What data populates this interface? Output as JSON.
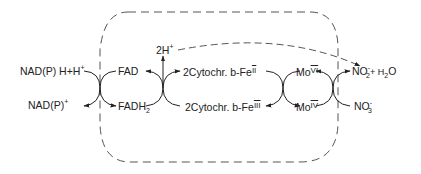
{
  "diagram": {
    "colors": {
      "ink": "#222222",
      "dash": "#555555",
      "background": "#ffffff"
    },
    "labels": {
      "nadph_reduced": {
        "main": "NAD(P) H+H",
        "sup": "+"
      },
      "nadp_oxidized": {
        "main": "NAD(P)",
        "sup": "+"
      },
      "fad": {
        "main": "FAD"
      },
      "fadh2": {
        "main": "FADH",
        "sub": "2"
      },
      "protons": {
        "main": "2H",
        "sup": "+"
      },
      "cyt_fe2": {
        "main": "2Cytochr. b-Fe",
        "roman": "II"
      },
      "cyt_fe3": {
        "main": "2Cytochr. b-Fe",
        "roman": "III"
      },
      "mo6": {
        "main": "Mo",
        "roman": "VI"
      },
      "mo4": {
        "main": "Mo",
        "roman": "IV"
      },
      "nitrite_water": {
        "main": "NO",
        "sub": "2",
        "sup": "-",
        "rest": "+ H",
        "sub2": "2",
        "tail": "O"
      },
      "nitrate": {
        "main": "NO",
        "sub": "3",
        "sup": "-"
      }
    },
    "boundary": {
      "style": "dashed rounded rectangle",
      "meaning": "enzyme complex"
    },
    "flows": [
      {
        "from": "NAD(P)H+H+",
        "to": "NAD(P)+",
        "coupled_with": "FAD -> FADH2"
      },
      {
        "from": "FADH2",
        "to": "FAD",
        "coupled_with": "2Cyt b-FeIII -> 2Cyt b-FeII",
        "releases": "2H+"
      },
      {
        "from": "2Cyt b-FeII",
        "to": "2Cyt b-FeIII",
        "coupled_with": "MoVI -> MoIV"
      },
      {
        "from": "MoIV",
        "to": "MoVI",
        "coupled_with": "NO3- -> NO2- + H2O"
      },
      {
        "from": "2H+",
        "to": "NO2- + H2O",
        "style": "dashed"
      }
    ]
  }
}
